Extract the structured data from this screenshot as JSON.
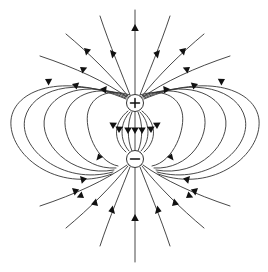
{
  "figure": {
    "background_color": "#ffffff",
    "line_color": "#333333",
    "arrow_color": "#111111",
    "width": 268,
    "height": 272
  },
  "charges": [
    {
      "id": "positive-charge",
      "sign": "+",
      "label": "+",
      "cx": 135,
      "cy": 103,
      "r": 8.5
    },
    {
      "id": "negative-charge",
      "sign": "−",
      "label": "−",
      "cx": 135,
      "cy": 159,
      "r": 8.5
    }
  ],
  "axis": {
    "name": "vertical-symmetry-axis",
    "x": 135,
    "top_y": 10,
    "bottom_y": 262,
    "arrow_directions": [
      "up",
      "up"
    ],
    "arrow_positions_y": [
      24,
      214
    ]
  },
  "chart_data": {
    "type": "line",
    "xlabel": "",
    "ylabel": "",
    "xlim": [
      0,
      268
    ],
    "ylim": [
      0,
      272
    ],
    "grid": false,
    "legend": null,
    "series": [
      {
        "name": "inner-lines",
        "count": 7,
        "note": "short nearly-straight lines directly between the two charges, arrows pointing downward"
      },
      {
        "name": "left-lobes",
        "count": 5,
        "note": "nested closed loops bulging left; arrows run counterclockwise from + around to -"
      },
      {
        "name": "right-lobes",
        "count": 5,
        "note": "nested closed loops bulging right; arrows run clockwise from + around to -"
      },
      {
        "name": "outer-lines",
        "count": 12,
        "note": "long lines leaving the top of the positive charge and entering the bottom of the negative charge"
      }
    ],
    "annotations": [
      {
        "text": "+",
        "x": 135,
        "y": 103
      },
      {
        "text": "−",
        "x": 135,
        "y": 159
      }
    ]
  }
}
